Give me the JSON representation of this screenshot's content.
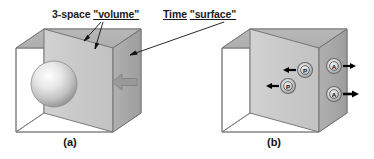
{
  "figure": {
    "title_annotations": [
      {
        "id": "volume-label",
        "text": "3-space \"volume\"",
        "plain": "3-space",
        "quoted": "\"volume\""
      },
      {
        "id": "surface-label",
        "text": "Time \"surface\"",
        "plain": "Time",
        "quoted": "\"surface\""
      }
    ],
    "panels": [
      {
        "id": "panel-a",
        "caption": "(a)"
      },
      {
        "id": "panel-b",
        "caption": "(b)"
      }
    ],
    "particles": [
      {
        "id": "particle-p-upper",
        "letter": "P",
        "arrow_direction": "left"
      },
      {
        "id": "particle-p-lower",
        "letter": "P",
        "arrow_direction": "left"
      },
      {
        "id": "particle-a-upper",
        "letter": "A",
        "arrow_direction": "right"
      },
      {
        "id": "particle-a-lower",
        "letter": "A",
        "arrow_direction": "right"
      }
    ],
    "block_arrow": {
      "id": "flux-arrow",
      "direction": "left"
    },
    "sphere": {
      "id": "volume-sphere"
    },
    "colors": {
      "top_face": "#b3b3b3",
      "front_face": "#cccccc",
      "right_face": "#a8a8a8",
      "edge": "#6e6e6e",
      "text": "#1a1a1a",
      "arrow_fill": "#9a9a9a",
      "marker_fill": "#bdbdbd",
      "black": "#000000",
      "background": "#ffffff"
    }
  }
}
